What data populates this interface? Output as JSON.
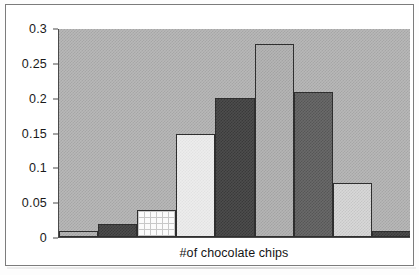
{
  "chart_data": {
    "type": "bar",
    "title": "",
    "subtitle": "",
    "xlabel": "#of chocolate chips",
    "ylabel": "",
    "categories": [
      "1",
      "2",
      "3",
      "4",
      "5",
      "6",
      "7",
      "8",
      "9"
    ],
    "values": [
      0.009,
      0.019,
      0.039,
      0.148,
      0.199,
      0.277,
      0.208,
      0.078,
      0.008
    ],
    "series": [
      {
        "name": "relative frequency",
        "values": [
          0.009,
          0.019,
          0.039,
          0.148,
          0.199,
          0.277,
          0.208,
          0.078,
          0.008
        ]
      }
    ],
    "bar_fills": [
      "medium-gray-dither",
      "dark-gray-dither",
      "white-grid",
      "lightest-gray-dither",
      "dark-gray-dither",
      "medium-gray-dither",
      "dark-gray-dither",
      "light-gray-dither",
      "dark-gray-dither"
    ],
    "ylim": [
      0,
      0.3
    ],
    "ytick_values": [
      0,
      0.05,
      0.1,
      0.15,
      0.2,
      0.25,
      0.3
    ],
    "ytick_labels": [
      "0",
      "0.05",
      "0.1",
      "0.15",
      "0.2",
      "0.25",
      "0.3"
    ],
    "xtick_labels": [],
    "grid": false,
    "legend": false,
    "legend_position": "none",
    "annotations": [],
    "plot_background_color": "#b8b8b8",
    "axis_line_color": "#4a4a4a",
    "frame_border_color": "#7c7c7c",
    "text_color": "#1a1a1a"
  }
}
